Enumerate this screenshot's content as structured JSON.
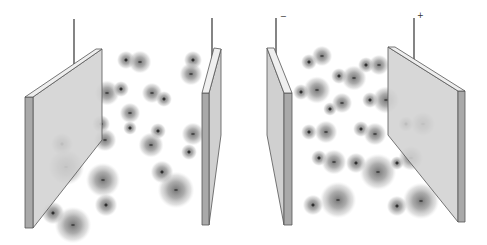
{
  "figure": {
    "panels": [
      {
        "name": "left-panel",
        "description": "Electrolyte between two uncharged plates: ions randomly distributed",
        "wire_labels": []
      },
      {
        "name": "right-panel",
        "description": "Electrolyte between charged plates: cations drift toward negative plate, anions toward positive plate",
        "wire_labels": [
          {
            "text": "−",
            "x": 283,
            "y": 15
          },
          {
            "text": "+",
            "x": 418,
            "y": 13
          }
        ]
      }
    ],
    "colors": {
      "plate_face": "#d0d0d0",
      "plate_edge": "#a8a8a8",
      "plate_top": "#eeeeee",
      "plate_stroke": "#555555",
      "wire": "#333333",
      "ion_core": "#7a7a7a",
      "ion_sign": "#111111"
    },
    "ions": [
      {
        "sign": "+",
        "x": 126,
        "y": 60,
        "r": 8
      },
      {
        "sign": "−",
        "x": 140,
        "y": 62,
        "r": 10
      },
      {
        "sign": "+",
        "x": 193,
        "y": 60,
        "r": 8
      },
      {
        "sign": "−",
        "x": 191,
        "y": 74,
        "r": 10
      },
      {
        "sign": "−",
        "x": 107,
        "y": 93,
        "r": 11
      },
      {
        "sign": "+",
        "x": 121,
        "y": 89,
        "r": 7
      },
      {
        "sign": "−",
        "x": 152,
        "y": 93,
        "r": 9
      },
      {
        "sign": "+",
        "x": 164,
        "y": 99,
        "r": 7
      },
      {
        "sign": "−",
        "x": 130,
        "y": 113,
        "r": 9
      },
      {
        "sign": "+",
        "x": 101,
        "y": 124,
        "r": 8
      },
      {
        "sign": "+",
        "x": 130,
        "y": 128,
        "r": 6
      },
      {
        "sign": "−",
        "x": 105,
        "y": 140,
        "r": 10
      },
      {
        "sign": "+",
        "x": 158,
        "y": 131,
        "r": 7
      },
      {
        "sign": "−",
        "x": 151,
        "y": 145,
        "r": 11
      },
      {
        "sign": "−",
        "x": 193,
        "y": 134,
        "r": 10
      },
      {
        "sign": "+",
        "x": 189,
        "y": 152,
        "r": 7
      },
      {
        "sign": "−",
        "x": 103,
        "y": 180,
        "r": 15
      },
      {
        "sign": "+",
        "x": 162,
        "y": 172,
        "r": 10
      },
      {
        "sign": "−",
        "x": 176,
        "y": 190,
        "r": 16
      },
      {
        "sign": "+",
        "x": 106,
        "y": 205,
        "r": 10
      },
      {
        "sign": "+",
        "x": 62,
        "y": 144,
        "r": 10
      },
      {
        "sign": "−",
        "x": 66,
        "y": 167,
        "r": 16
      },
      {
        "sign": "+",
        "x": 53,
        "y": 213,
        "r": 10
      },
      {
        "sign": "−",
        "x": 73,
        "y": 225,
        "r": 16
      },
      {
        "sign": "+",
        "x": 309,
        "y": 62,
        "r": 7
      },
      {
        "sign": "−",
        "x": 322,
        "y": 56,
        "r": 9
      },
      {
        "sign": "+",
        "x": 366,
        "y": 65,
        "r": 7
      },
      {
        "sign": "−",
        "x": 379,
        "y": 65,
        "r": 9
      },
      {
        "sign": "+",
        "x": 339,
        "y": 76,
        "r": 7
      },
      {
        "sign": "−",
        "x": 354,
        "y": 78,
        "r": 11
      },
      {
        "sign": "+",
        "x": 301,
        "y": 92,
        "r": 7
      },
      {
        "sign": "−",
        "x": 317,
        "y": 90,
        "r": 12
      },
      {
        "sign": "+",
        "x": 370,
        "y": 100,
        "r": 7
      },
      {
        "sign": "−",
        "x": 386,
        "y": 100,
        "r": 12
      },
      {
        "sign": "+",
        "x": 330,
        "y": 109,
        "r": 6
      },
      {
        "sign": "−",
        "x": 342,
        "y": 103,
        "r": 9
      },
      {
        "sign": "+",
        "x": 309,
        "y": 132,
        "r": 7
      },
      {
        "sign": "−",
        "x": 326,
        "y": 132,
        "r": 10
      },
      {
        "sign": "+",
        "x": 361,
        "y": 129,
        "r": 7
      },
      {
        "sign": "−",
        "x": 375,
        "y": 134,
        "r": 10
      },
      {
        "sign": "+",
        "x": 406,
        "y": 124,
        "r": 7
      },
      {
        "sign": "−",
        "x": 423,
        "y": 124,
        "r": 11
      },
      {
        "sign": "+",
        "x": 319,
        "y": 158,
        "r": 7
      },
      {
        "sign": "−",
        "x": 334,
        "y": 162,
        "r": 11
      },
      {
        "sign": "+",
        "x": 356,
        "y": 163,
        "r": 9
      },
      {
        "sign": "−",
        "x": 378,
        "y": 172,
        "r": 16
      },
      {
        "sign": "+",
        "x": 397,
        "y": 163,
        "r": 6
      },
      {
        "sign": "−",
        "x": 411,
        "y": 158,
        "r": 11
      },
      {
        "sign": "+",
        "x": 313,
        "y": 205,
        "r": 9
      },
      {
        "sign": "−",
        "x": 338,
        "y": 200,
        "r": 16
      },
      {
        "sign": "+",
        "x": 397,
        "y": 206,
        "r": 9
      },
      {
        "sign": "−",
        "x": 421,
        "y": 201,
        "r": 16
      }
    ]
  }
}
